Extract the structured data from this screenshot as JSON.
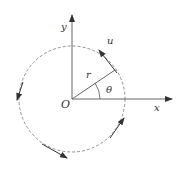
{
  "diagram": {
    "type": "polar-coordinate / circular motion diagram",
    "labels": {
      "y_axis": "y",
      "x_axis": "x",
      "origin": "O",
      "radius": "r",
      "angle": "θ",
      "velocity": "u"
    },
    "geometry": {
      "origin": [
        72,
        99
      ],
      "circle_radius": 53,
      "radius_angle_deg": 35
    },
    "colors": {
      "stroke": "#444444",
      "dashed_circle": "#777777",
      "text": "#333333"
    }
  }
}
